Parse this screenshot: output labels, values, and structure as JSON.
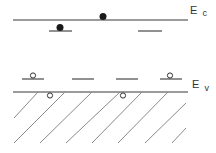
{
  "diagram": {
    "conduction_band": {
      "label_main": "E",
      "label_sub": "c"
    },
    "valence_band": {
      "label_main": "E",
      "label_sub": "v"
    },
    "donor_levels": [
      {
        "state": "occupied-electron"
      },
      {
        "state": "empty"
      }
    ],
    "conduction_band_carriers": [
      {
        "type": "electron"
      }
    ],
    "acceptor_levels": [
      {
        "state": "hole"
      },
      {
        "state": "empty"
      },
      {
        "state": "empty"
      },
      {
        "state": "hole"
      }
    ],
    "valence_band_carriers": [
      {
        "type": "hole"
      },
      {
        "type": "hole"
      }
    ],
    "colors": {
      "line": "#7a7a7a",
      "electron": "#1a1a1a",
      "hole_stroke": "#333333",
      "background": "#ffffff"
    }
  }
}
